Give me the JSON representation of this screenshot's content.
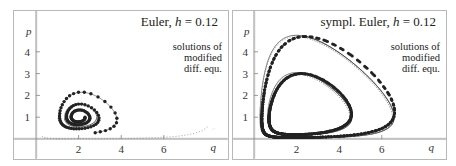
{
  "chart_data": [
    {
      "type": "line",
      "title": "Euler, h = 0.12",
      "title_method": "Euler, ",
      "title_h": "h",
      "title_value": " = 0.12",
      "annotation": [
        "solutions of",
        "modified",
        "diff. equ."
      ],
      "xlabel": "q",
      "ylabel": "p",
      "x_ticks": [
        2,
        4,
        6
      ],
      "y_ticks": [
        1,
        2,
        3,
        4
      ],
      "xlim": [
        -0.1,
        8.7
      ],
      "ylim": [
        -1.0,
        5.8
      ],
      "grid": false,
      "description": "Explicit Euler trajectory (dots) of Lotka-Volterra system spiralling outward from start near (2.3,1) ... plotted with solutions of modified differential equations (thin solid/dotted lines)",
      "series": [
        {
          "name": "Euler steps (dots), spiral",
          "points_approx": [
            [
              2.3,
              1.0
            ],
            [
              2.8,
              1.6
            ],
            [
              2.2,
              1.9
            ],
            [
              1.3,
              1.5
            ],
            [
              1.0,
              0.9
            ],
            [
              1.5,
              0.5
            ],
            [
              2.5,
              0.45
            ],
            [
              3.2,
              0.8
            ],
            [
              3.0,
              1.8
            ],
            [
              2.2,
              2.7
            ],
            [
              1.2,
              2.3
            ],
            [
              0.7,
              1.2
            ],
            [
              0.8,
              0.3
            ],
            [
              2.0,
              0.15
            ],
            [
              3.5,
              0.3
            ],
            [
              4.6,
              0.9
            ],
            [
              4.0,
              2.0
            ],
            [
              2.7,
              2.7
            ],
            [
              1.4,
              2.6
            ],
            [
              0.5,
              1.6
            ],
            [
              0.4,
              0.5
            ],
            [
              1.5,
              0.1
            ],
            [
              3.5,
              0.1
            ],
            [
              5.0,
              0.3
            ],
            [
              6.8,
              0.6
            ],
            [
              8.1,
              1.0
            ],
            [
              7.0,
              2.3
            ],
            [
              5.1,
              3.6
            ],
            [
              3.6,
              4.5
            ],
            [
              2.5,
              4.75
            ],
            [
              1.7,
              4.6
            ],
            [
              1.0,
              4.2
            ]
          ]
        },
        {
          "name": "modified equation solution (solid)",
          "style": "solid thin"
        },
        {
          "name": "modified equation solution (dotted)",
          "style": "dotted"
        }
      ]
    },
    {
      "type": "line",
      "title": "sympl. Euler, h = 0.12",
      "title_method": "sympl. Euler, ",
      "title_h": "h",
      "title_value": " = 0.12",
      "annotation": [
        "solutions of",
        "modified",
        "diff. equ."
      ],
      "xlabel": "q",
      "ylabel": "p",
      "x_ticks": [
        2,
        4,
        6
      ],
      "y_ticks": [
        1,
        2,
        3,
        4
      ],
      "xlim": [
        -0.1,
        8.7
      ],
      "ylim": [
        -1.0,
        5.8
      ],
      "grid": false,
      "description": "Symplectic Euler trajectories (dots) staying on closed orbits, with solutions of modified differential equations (thin lines)",
      "series": [
        {
          "name": "outer orbit",
          "q_range": [
            0.35,
            6.7
          ],
          "p_range": [
            0.05,
            4.75
          ]
        },
        {
          "name": "inner orbit",
          "q_range": [
            0.6,
            4.7
          ],
          "p_range": [
            0.15,
            3.05
          ]
        }
      ]
    }
  ],
  "panels": {
    "left": {
      "title_method": "Euler, ",
      "title_h": "h",
      "title_value": " = 0.12",
      "note1": "solutions of",
      "note2": "modified",
      "note3": "diff. equ.",
      "xlabel": "q",
      "ylabel": "p"
    },
    "right": {
      "title_method": "sympl. Euler, ",
      "title_h": "h",
      "title_value": " = 0.12",
      "note1": "solutions of",
      "note2": "modified",
      "note3": "diff. equ.",
      "xlabel": "q",
      "ylabel": "p"
    }
  },
  "ticks": {
    "x": [
      "2",
      "4",
      "6"
    ],
    "y": [
      "1",
      "2",
      "3",
      "4"
    ]
  }
}
